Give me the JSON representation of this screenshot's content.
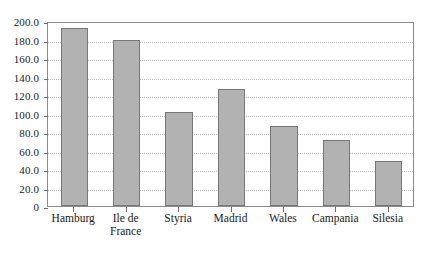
{
  "chart_data": {
    "type": "bar",
    "title": "",
    "xlabel": "",
    "ylabel": "",
    "ylim": [
      0,
      200
    ],
    "ytick_step": 20,
    "grid": true,
    "legend": false,
    "categories": [
      "Hamburg",
      "Ile de\nFrance",
      "Styria",
      "Madrid",
      "Wales",
      "Campania",
      "Silesia"
    ],
    "values": [
      192,
      179,
      102,
      126,
      87,
      71,
      49
    ],
    "ytick_labels": [
      "200.0",
      "180.0",
      "160.0",
      "140.0",
      "120.0",
      "100.0",
      "80.0",
      "60.0",
      "40.0",
      "20.0",
      "0"
    ],
    "ytick_values": [
      200,
      180,
      160,
      140,
      120,
      100,
      80,
      60,
      40,
      20,
      0
    ],
    "colors": {
      "bar_fill": "#b2b2b2",
      "bar_border": "#777777",
      "gridline": "#bdbdbd",
      "axis": "#8c8c8c",
      "text": "#1a1a1a",
      "background": "#ffffff"
    }
  }
}
